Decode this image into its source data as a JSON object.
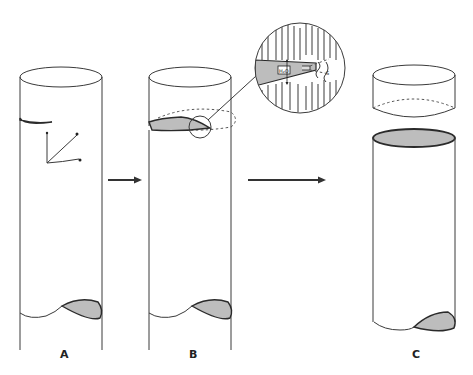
{
  "figure": {
    "panels": [
      {
        "id": "A",
        "label": "A",
        "description": "Intact cylinder with initial crack and coordinate axes"
      },
      {
        "id": "B",
        "label": "B",
        "description": "Crack propagates around circumference; magnified inset of crack tip"
      },
      {
        "id": "C",
        "label": "C",
        "description": "Cylinder fully separated into two pieces"
      }
    ],
    "axes": {
      "labels": [
        "c",
        "b",
        "a"
      ]
    },
    "inset": {
      "water_label": "H2O",
      "tip_label": "S"
    },
    "colors": {
      "line": "#3a3a3a",
      "fill": "#bdbdbd",
      "background": "#ffffff"
    }
  }
}
